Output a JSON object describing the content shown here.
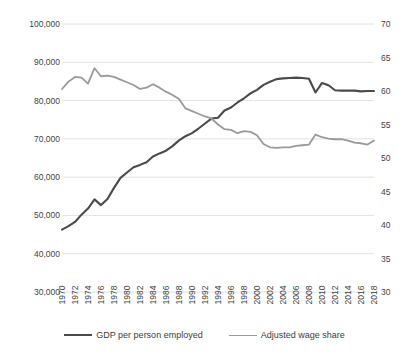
{
  "chart_data": {
    "type": "line",
    "title": "",
    "xlabel": "",
    "grid": true,
    "legend_position": "bottom",
    "x": [
      1970,
      1971,
      1972,
      1973,
      1974,
      1975,
      1976,
      1977,
      1978,
      1979,
      1980,
      1981,
      1982,
      1983,
      1984,
      1985,
      1986,
      1987,
      1988,
      1989,
      1990,
      1991,
      1992,
      1993,
      1994,
      1995,
      1996,
      1997,
      1998,
      1999,
      2000,
      2001,
      2002,
      2003,
      2004,
      2005,
      2006,
      2007,
      2008,
      2009,
      2010,
      2011,
      2012,
      2013,
      2014,
      2015,
      2016,
      2017,
      2018
    ],
    "tick_labels_x": [
      "1970",
      "1972",
      "1974",
      "1976",
      "1978",
      "1980",
      "1982",
      "1984",
      "1986",
      "1988",
      "1990",
      "1992",
      "1994",
      "1996",
      "1998",
      "2000",
      "2002",
      "2004",
      "2006",
      "2008",
      "2010",
      "2012",
      "2014",
      "2016",
      "2018"
    ],
    "axes": {
      "left": {
        "label": "",
        "ylim": [
          30000,
          100000
        ],
        "ticks": [
          30000,
          40000,
          50000,
          60000,
          70000,
          80000,
          90000,
          100000
        ],
        "tick_labels": [
          "30,000",
          "40,000",
          "50,000",
          "60,000",
          "70,000",
          "80,000",
          "90,000",
          "100,000"
        ]
      },
      "right": {
        "label": "",
        "ylim": [
          30,
          70
        ],
        "ticks": [
          30,
          35,
          40,
          45,
          50,
          55,
          60,
          65,
          70
        ],
        "tick_labels": [
          "30",
          "35",
          "40",
          "45",
          "50",
          "55",
          "60",
          "65",
          "70"
        ]
      }
    },
    "series": [
      {
        "name": "GDP per person employed",
        "axis": "left",
        "color": "#4a4a4a",
        "width": 2.1,
        "values": [
          46300,
          47200,
          48300,
          50200,
          51800,
          54200,
          52700,
          54300,
          57200,
          59800,
          61200,
          62600,
          63200,
          63900,
          65400,
          66200,
          66900,
          68100,
          69600,
          70700,
          71500,
          72700,
          74000,
          75300,
          75500,
          77400,
          78200,
          79500,
          80600,
          81900,
          82800,
          84100,
          84900,
          85600,
          85800,
          85900,
          86000,
          85900,
          85700,
          82100,
          84600,
          84000,
          82700,
          82600,
          82600,
          82600,
          82400,
          82500,
          82500
        ]
      },
      {
        "name": "Adjusted wage share",
        "axis": "right",
        "color": "#9a9a9a",
        "width": 1.8,
        "values": [
          60.3,
          61.4,
          62.1,
          62.0,
          61.1,
          63.4,
          62.2,
          62.3,
          62.1,
          61.7,
          61.3,
          60.9,
          60.3,
          60.5,
          61.0,
          60.5,
          59.9,
          59.4,
          58.8,
          57.4,
          57.0,
          56.6,
          56.2,
          55.9,
          55.0,
          54.3,
          54.2,
          53.7,
          54.0,
          53.9,
          53.4,
          52.1,
          51.6,
          51.5,
          51.6,
          51.6,
          51.8,
          51.9,
          52.0,
          53.5,
          53.1,
          52.9,
          52.8,
          52.8,
          52.6,
          52.3,
          52.2,
          52.0,
          52.6
        ]
      }
    ]
  },
  "legend": {
    "items": [
      {
        "label": "GDP per person employed",
        "color": "#4a4a4a",
        "width": "2.2px"
      },
      {
        "label": "Adjusted wage share",
        "color": "#9a9a9a",
        "width": "1.8px"
      }
    ]
  }
}
